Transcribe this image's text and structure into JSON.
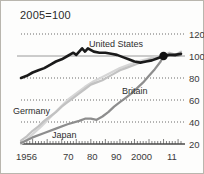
{
  "chart_data": {
    "type": "line",
    "title": "2005=100",
    "xlabel": "",
    "ylabel": "",
    "ylim": [
      20,
      120
    ],
    "xlim": [
      1956,
      2011
    ],
    "grid": true,
    "grid_style": "dotted horizontal gridlines at 120, 80, 60, 40; solid reference line at 100",
    "legend": "inline series labels on plot",
    "yticks": [
      120,
      100,
      80,
      60,
      40,
      20
    ],
    "ytick_labels": [
      "120",
      "100",
      "80",
      "60",
      "40",
      "20"
    ],
    "xticks": [
      1956,
      1970,
      1980,
      1990,
      2000,
      2011
    ],
    "xtick_labels": [
      "1956",
      "70",
      "80",
      "90",
      "2000",
      "11"
    ],
    "annotations": [
      {
        "name": "convergence-marker",
        "label": "",
        "x": 2005,
        "y": 100,
        "shape": "filled-circle"
      }
    ],
    "series": [
      {
        "name": "United States",
        "color": "#1a1a1a",
        "width": 2.6,
        "x": [
          1956,
          1958,
          1960,
          1962,
          1964,
          1966,
          1968,
          1970,
          1972,
          1974,
          1975,
          1976,
          1977,
          1978,
          1979,
          1981,
          1983,
          1985,
          1987,
          1989,
          1991,
          1993,
          1995,
          1997,
          1999,
          2001,
          2003,
          2005,
          2007,
          2009,
          2011
        ],
        "values": [
          80,
          82,
          85,
          87,
          89,
          92,
          95,
          97,
          100,
          103,
          101,
          104,
          107,
          104,
          107,
          104,
          103,
          103,
          102,
          101,
          99,
          97,
          95,
          94,
          95,
          96,
          98,
          100,
          101,
          101,
          102
        ]
      },
      {
        "name": "Britain",
        "color": "#8d8d8d",
        "width": 2.2,
        "x": [
          1956,
          1960,
          1964,
          1968,
          1972,
          1976,
          1978,
          1980,
          1982,
          1984,
          1986,
          1988,
          1990,
          1992,
          1994,
          1996,
          1998,
          2000,
          2002,
          2004,
          2005,
          2007,
          2009,
          2011
        ],
        "values": [
          21,
          26,
          30,
          34,
          38,
          41,
          43,
          43,
          42,
          45,
          49,
          54,
          58,
          62,
          66,
          71,
          76,
          82,
          88,
          95,
          100,
          101,
          100,
          101
        ]
      },
      {
        "name": "Germany",
        "color": "#c2c2c2",
        "width": 2.2,
        "x": [
          1956,
          1958,
          1960,
          1962,
          1964,
          1966,
          1968,
          1970,
          1972,
          1974,
          1976,
          1978,
          1980,
          1982,
          1984,
          1986,
          1988,
          1990,
          1992,
          1994,
          1996,
          1998,
          2000,
          2002,
          2004,
          2005,
          2007,
          2009,
          2011
        ],
        "values": [
          23,
          27,
          32,
          36,
          41,
          45,
          49,
          54,
          58,
          62,
          66,
          70,
          74,
          76,
          78,
          81,
          84,
          87,
          89,
          91,
          93,
          95,
          97,
          98,
          99,
          100,
          103,
          101,
          104
        ]
      },
      {
        "name": "Japan",
        "color": "#d6d6d6",
        "width": 2.2,
        "x": [
          1956,
          1958,
          1960,
          1963,
          1966,
          1969,
          1972,
          1975,
          1978,
          1981,
          1984,
          1987,
          1990,
          1993,
          1996,
          1999,
          2002,
          2005,
          2008,
          2011
        ],
        "values": [
          20,
          24,
          29,
          36,
          44,
          52,
          60,
          66,
          72,
          77,
          81,
          85,
          89,
          92,
          95,
          97,
          99,
          100,
          102,
          101
        ]
      }
    ],
    "series_labels": [
      {
        "name": "United States",
        "text": "United States",
        "left": 88,
        "top": 38
      },
      {
        "name": "Britain",
        "text": "Britain",
        "left": 121,
        "top": 85
      },
      {
        "name": "Germany",
        "text": "Germany",
        "left": 12,
        "top": 105
      },
      {
        "name": "Japan",
        "text": "Japan",
        "left": 51,
        "top": 129
      }
    ]
  },
  "axis": {
    "y_labels": [
      {
        "text": "120",
        "top": 28
      },
      {
        "text": "100",
        "top": 50
      },
      {
        "text": "80",
        "top": 72
      },
      {
        "text": "60",
        "top": 94
      },
      {
        "text": "40",
        "top": 116
      },
      {
        "text": "20",
        "top": 138
      }
    ],
    "x_labels": [
      {
        "text": "1956",
        "left": 15
      },
      {
        "text": "70",
        "left": 62
      },
      {
        "text": "80",
        "left": 86
      },
      {
        "text": "90",
        "left": 110
      },
      {
        "text": "2000",
        "left": 130
      },
      {
        "text": "11",
        "left": 166
      }
    ]
  },
  "colors": {
    "frame": "#b9b6ae",
    "background": "#fdfdfc",
    "text": "#2b2b2b",
    "gridline": "#5a5a5a",
    "baseline": "#4a4a4a",
    "reference_line": "#9a9a9a"
  }
}
